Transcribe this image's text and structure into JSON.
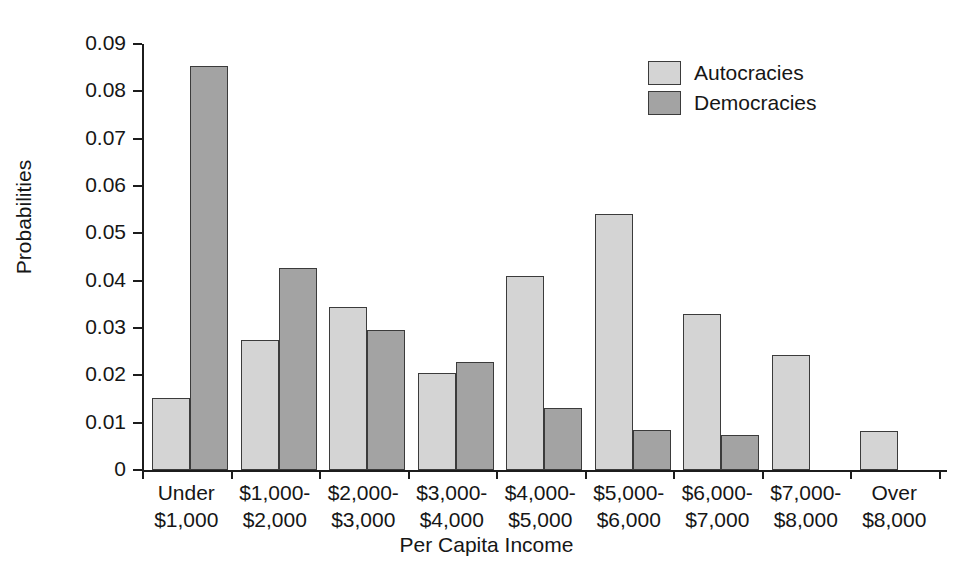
{
  "chart_data": {
    "type": "bar",
    "title": "",
    "xlabel": "Per Capita Income",
    "ylabel": "Probabilities",
    "ylim": [
      0,
      0.09
    ],
    "ytick_labels": [
      "0.09",
      "0.08",
      "0.07",
      "0.06",
      "0.05",
      "0.04",
      "0.03",
      "0.02",
      "0.01",
      "0"
    ],
    "ytick_values": [
      0.09,
      0.08,
      0.07,
      0.06,
      0.05,
      0.04,
      0.03,
      0.02,
      0.01,
      0
    ],
    "grid": false,
    "legend_position": "top-right",
    "categories": [
      "Under\n$1,000",
      "$1,000-\n$2,000",
      "$2,000-\n$3,000",
      "$3,000-\n$4,000",
      "$4,000-\n$5,000",
      "$5,000-\n$6,000",
      "$6,000-\n$7,000",
      "$7,000-\n$8,000",
      "Over\n$8,000"
    ],
    "category_lines": [
      [
        "Under",
        "$1,000"
      ],
      [
        "$1,000-",
        "$2,000"
      ],
      [
        "$2,000-",
        "$3,000"
      ],
      [
        "$3,000-",
        "$4,000"
      ],
      [
        "$4,000-",
        "$5,000"
      ],
      [
        "$5,000-",
        "$6,000"
      ],
      [
        "$6,000-",
        "$7,000"
      ],
      [
        "$7,000-",
        "$8,000"
      ],
      [
        "Over",
        "$8,000"
      ]
    ],
    "series": [
      {
        "name": "Autocracies",
        "color": "#d4d4d4",
        "values": [
          0.0152,
          0.0275,
          0.0345,
          0.0205,
          0.041,
          0.0541,
          0.033,
          0.0243,
          0.0082
        ]
      },
      {
        "name": "Democracies",
        "color": "#a3a3a3",
        "values": [
          0.0853,
          0.0427,
          0.0296,
          0.0228,
          0.0131,
          0.0084,
          0.0074,
          null,
          null
        ]
      }
    ]
  },
  "legend": {
    "items": [
      {
        "label": "Autocracies",
        "swatch": "autocracies"
      },
      {
        "label": "Democracies",
        "swatch": "democracies"
      }
    ]
  }
}
